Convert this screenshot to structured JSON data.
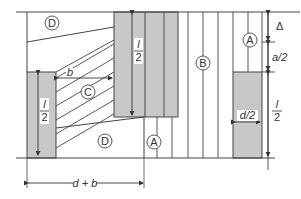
{
  "diagram": {
    "regions": [
      {
        "id": "D_top",
        "label": "D"
      },
      {
        "id": "C",
        "label": "C"
      },
      {
        "id": "D_bottom",
        "label": "D"
      },
      {
        "id": "B",
        "label": "B"
      },
      {
        "id": "A_right",
        "label": "A"
      },
      {
        "id": "A_bottom",
        "label": "A"
      }
    ],
    "dimensions": {
      "left_bar_height": {
        "num": "l",
        "den": "2"
      },
      "center_bar_height": {
        "num": "l",
        "den": "2"
      },
      "right_bar_height": {
        "num": "l",
        "den": "2"
      },
      "gap_b": "b",
      "bottom_span": "d + b",
      "right_width": "d/2",
      "delta": "Δ",
      "half_a": "a/2"
    },
    "colors": {
      "bar_fill": "#c8c8c8",
      "line": "#444444"
    }
  }
}
